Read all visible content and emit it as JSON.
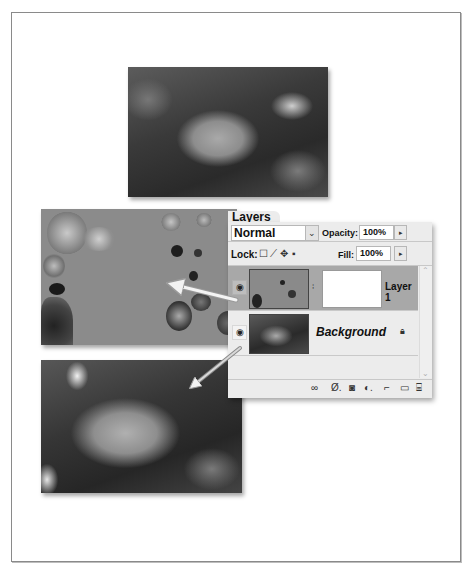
{
  "figure": {
    "photos": [
      {
        "name": "composite-result-top",
        "description": "underwater shell photo"
      },
      {
        "name": "layer1-content",
        "description": "Layer 1 pixels over gray"
      },
      {
        "name": "background-content",
        "description": "background shell photo"
      }
    ]
  },
  "layers_panel": {
    "tab_label": "Layers",
    "blend_mode": "Normal",
    "opacity_label": "Opacity:",
    "opacity_value": "100%",
    "lock_label": "Lock:",
    "fill_label": "Fill:",
    "fill_value": "100%",
    "lock_icons": [
      "lock-transparent-icon",
      "lock-image-icon",
      "lock-position-icon",
      "lock-all-icon"
    ],
    "layers": [
      {
        "name": "Layer 1",
        "visible": true,
        "selected": true,
        "has_mask": true
      },
      {
        "name": "Background",
        "visible": true,
        "selected": false,
        "locked": true
      }
    ],
    "footer_icons": [
      "link-layers-icon",
      "layer-style-icon",
      "add-mask-icon",
      "adjustment-layer-icon",
      "new-group-icon",
      "new-layer-icon",
      "trash-icon"
    ]
  },
  "glyphs": {
    "dropdown": "⌄",
    "stepper": "▸",
    "eye": "◉",
    "chain": "⁞",
    "lock": "🔒",
    "scroll_up": "⌃",
    "scroll_down": "⌄",
    "lock_transparent": "☐",
    "lock_image": "⟋",
    "lock_position": "✥",
    "lock_all": "▪",
    "fx": "Ø.",
    "mask": "◙",
    "adjust": "◐.",
    "group": "⌐",
    "new": "▭",
    "trash": "🗑"
  }
}
